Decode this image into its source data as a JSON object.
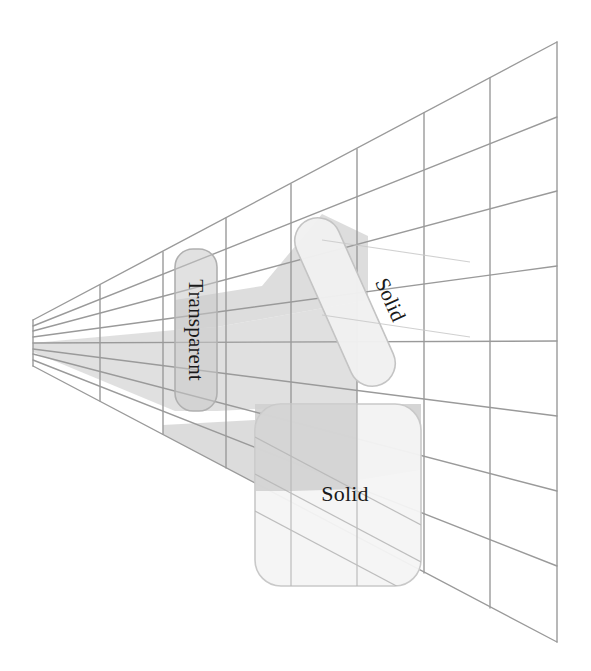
{
  "figure": {
    "title": "",
    "background_color": "#ffffff",
    "width": 591,
    "height": 671
  },
  "grid": {
    "name": "perspective-grid",
    "line_color": "#9a9a9a",
    "line_width": 1.5,
    "columns": 8,
    "rows": 8,
    "vanishing_edge": {
      "x": 33,
      "y_top": 320,
      "y_bottom": 366
    },
    "far_edge": {
      "x": 557,
      "y_top": 42,
      "y_bottom": 642
    },
    "column_x": [
      33,
      100,
      163,
      226,
      291,
      357,
      424,
      490,
      557
    ],
    "right_edge_y": [
      42,
      117,
      191,
      266,
      341,
      416,
      491,
      566,
      642
    ],
    "left_edge_y": [
      320,
      326,
      331,
      337,
      343,
      349,
      354,
      360,
      366
    ]
  },
  "shapes": [
    {
      "id": "transparent-box",
      "label": "Transparent",
      "kind": "rounded-rect",
      "fill": "#cccccc",
      "fill_opacity": 0.55,
      "stroke": "#b3b3b3",
      "rotation_deg": 0,
      "label_rotation_deg": 90,
      "x": 175,
      "y": 249,
      "width": 42,
      "height": 162,
      "radius": 18
    },
    {
      "id": "solid-pill",
      "label": "Solid",
      "kind": "rounded-rect",
      "fill": "#f2f2f2",
      "fill_opacity": 1,
      "stroke": "#c6c6c6",
      "rotation_deg": 66,
      "label_rotation_deg": 66,
      "x": 322,
      "y": 212,
      "width": 46,
      "height": 180,
      "radius": 22
    },
    {
      "id": "solid-box",
      "label": "Solid",
      "kind": "rounded-rect",
      "fill": "#f4f4f4",
      "fill_opacity": 1,
      "stroke": "#c9c9c9",
      "rotation_deg": 0,
      "label_rotation_deg": 0,
      "x": 255,
      "y": 404,
      "width": 166,
      "height": 182,
      "radius": 26
    }
  ],
  "shadows": [
    {
      "id": "transparent-shadow",
      "source": "transparent-box",
      "fill": "#c4c4c4",
      "fill_opacity": 0.55,
      "description": "perspective shadow cast from the transparent box toward the vanishing edge"
    },
    {
      "id": "solid-pill-shadow",
      "source": "solid-pill",
      "fill": "#dcdcdc",
      "fill_opacity": 0.8,
      "description": "perspective shadow cast from the solid pill"
    },
    {
      "id": "solid-box-shadow",
      "source": "solid-box",
      "fill": "#d2d2d2",
      "fill_opacity": 0.85,
      "description": "perspective shadow cast from the solid box"
    }
  ],
  "labels": {
    "transparent": "Transparent",
    "solid_pill": "Solid",
    "solid_box": "Solid"
  },
  "colors": {
    "grid_line": "#9a9a9a",
    "shape_stroke": "#c2c2c2",
    "transparent_fill": "#cccccc",
    "solid_fill": "#f2f2f2",
    "shadow_dark": "#c0c0c0",
    "shadow_light": "#dcdcdc",
    "text": "#1a1a1a",
    "background": "#ffffff"
  }
}
